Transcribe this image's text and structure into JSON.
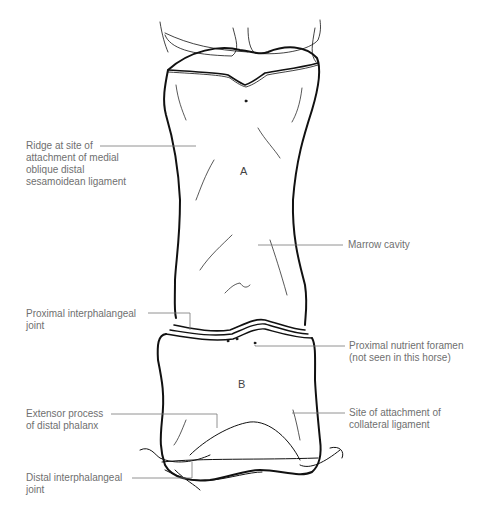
{
  "diagram": {
    "bones": [
      {
        "id": "A",
        "label": "A"
      },
      {
        "id": "B",
        "label": "B"
      }
    ],
    "labels": {
      "ridge": "Ridge at site of\nattachment of medial\noblique distal\nsesamoidean ligament",
      "marrow": "Marrow cavity",
      "pip_joint": "Proximal interphalangeal\njoint",
      "nutrient": "Proximal nutrient foramen\n(not seen in this horse)",
      "extensor": "Extensor process\nof distal phalanx",
      "collateral": "Site of attachment of\ncollateral ligament",
      "dip_joint": "Distal interphalangeal\njoint"
    },
    "colors": {
      "outline": "#111111",
      "leader": "#777777",
      "text": "#6f6f6f"
    }
  }
}
